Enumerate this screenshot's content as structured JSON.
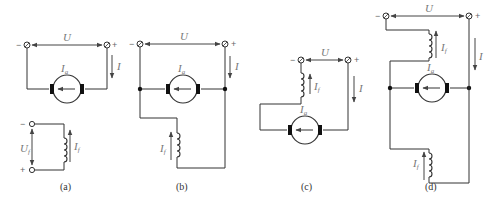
{
  "diagram": {
    "panels": [
      {
        "id": "a",
        "caption": "(a)",
        "voltage_label": "U",
        "current_label": "I",
        "armature_current_label": "I",
        "armature_current_sub": "a",
        "field_voltage_label": "U",
        "field_voltage_sub": "f",
        "field_current_label": "I",
        "field_current_sub": "f",
        "minus": "−",
        "plus": "+"
      },
      {
        "id": "b",
        "caption": "(b)",
        "voltage_label": "U",
        "current_label": "I",
        "armature_current_label": "I",
        "armature_current_sub": "a",
        "field_current_label": "I",
        "field_current_sub": "f",
        "minus": "−",
        "plus": "+"
      },
      {
        "id": "c",
        "caption": "(c)",
        "voltage_label": "U",
        "current_label": "I",
        "armature_current_label": "I",
        "armature_current_sub": "a",
        "field_current_label": "I",
        "field_current_sub": "f",
        "minus": "−",
        "plus": "+"
      },
      {
        "id": "d",
        "caption": "(d)",
        "voltage_label": "U",
        "current_label": "I",
        "armature_current_label": "I",
        "armature_current_sub": "a",
        "series_field_current_label": "I",
        "series_field_current_sub": "f",
        "shunt_field_current_label": "I",
        "shunt_field_current_sub": "f",
        "minus": "−",
        "plus": "+"
      }
    ]
  }
}
